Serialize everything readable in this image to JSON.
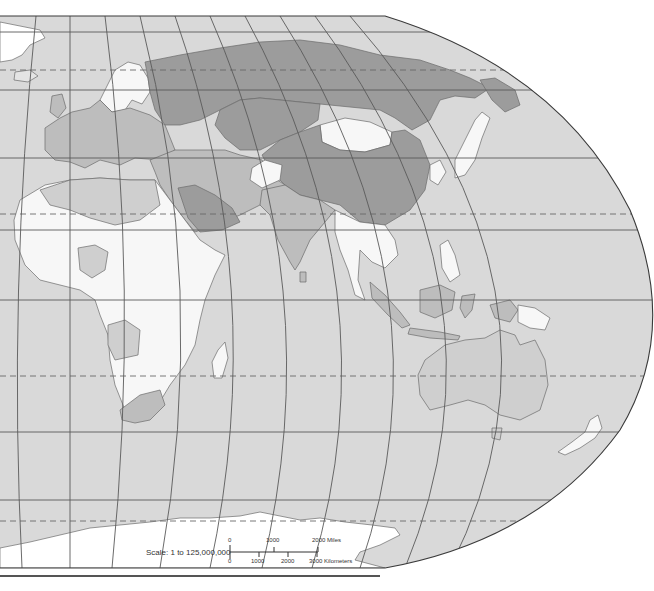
{
  "map": {
    "title": "Eastern Hemisphere political outline map",
    "projection": "Robinson-style pseudocylindrical",
    "colors": {
      "ocean": "#d9d9d9",
      "russia_china_central_asia": "#9c9c9c",
      "saudi_arabia": "#9c9c9c",
      "europe_mideast_india": "#bdbdbd",
      "australia": "#cfcfcf",
      "africa_se_asia": "#f7f7f7",
      "mongolia": "#f7f7f7",
      "antarctica_greenland": "#ffffff",
      "graticule": "#5a5a5a"
    },
    "regions": [
      {
        "name": "Russia",
        "shade": "dark"
      },
      {
        "name": "China",
        "shade": "dark"
      },
      {
        "name": "Kazakhstan",
        "shade": "dark"
      },
      {
        "name": "Mongolia",
        "shade": "white"
      },
      {
        "name": "Europe",
        "shade": "mid"
      },
      {
        "name": "Middle East",
        "shade": "mid"
      },
      {
        "name": "Saudi Arabia",
        "shade": "dark"
      },
      {
        "name": "India",
        "shade": "mid"
      },
      {
        "name": "Africa",
        "shade": "white"
      },
      {
        "name": "Southeast Asia",
        "shade": "white"
      },
      {
        "name": "Japan",
        "shade": "white"
      },
      {
        "name": "Indonesia",
        "shade": "mid"
      },
      {
        "name": "Papua New Guinea",
        "shade": "white"
      },
      {
        "name": "Australia",
        "shade": "light"
      },
      {
        "name": "New Zealand",
        "shade": "white"
      },
      {
        "name": "Madagascar",
        "shade": "white"
      },
      {
        "name": "South Africa",
        "shade": "mid"
      },
      {
        "name": "Antarctica",
        "shade": "ice"
      },
      {
        "name": "Greenland",
        "shade": "ice"
      }
    ]
  },
  "scale": {
    "label": "Scale:  1 to 125,000,000",
    "miles": {
      "ticks": [
        "0",
        "1000",
        "2000 Miles"
      ]
    },
    "kilometers": {
      "ticks": [
        "0",
        "1000",
        "2000",
        "3000 Kilometers"
      ]
    }
  }
}
